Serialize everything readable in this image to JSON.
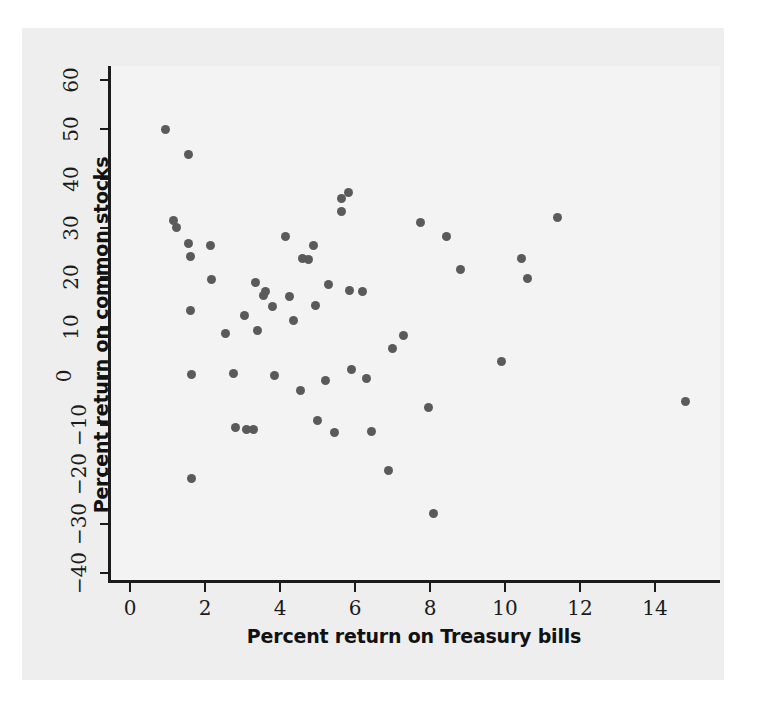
{
  "chart_data": {
    "type": "scatter",
    "title": "",
    "xlabel": "Percent return on Treasury bills",
    "ylabel": "Percent return on common stocks",
    "xlim": [
      -0.6,
      15.7
    ],
    "ylim": [
      -40,
      62
    ],
    "xticks": [
      0,
      2,
      4,
      6,
      8,
      10,
      12,
      14
    ],
    "xticklabels": [
      "0",
      "2",
      "4",
      "6",
      "8",
      "10",
      "12",
      "14"
    ],
    "yticks": [
      -40,
      -30,
      -20,
      -10,
      0,
      10,
      20,
      30,
      40,
      50,
      60
    ],
    "yticklabels": [
      "−40",
      "−30",
      "−20",
      "−10",
      "0",
      "10",
      "20",
      "30",
      "40",
      "50",
      "60"
    ],
    "grid": false,
    "legend": null,
    "marker_color": "#5a5a5a",
    "panel_color": "#f3f3f3",
    "figure_color": "#eeeeee",
    "axis_color": "#1b1b1b",
    "points": [
      [
        0.95,
        50.0
      ],
      [
        1.15,
        31.5
      ],
      [
        1.25,
        30.0
      ],
      [
        1.55,
        44.8
      ],
      [
        1.55,
        26.8
      ],
      [
        1.62,
        24.2
      ],
      [
        1.6,
        13.2
      ],
      [
        1.65,
        0.3
      ],
      [
        1.65,
        -20.9
      ],
      [
        2.15,
        26.5
      ],
      [
        2.18,
        19.5
      ],
      [
        2.55,
        8.5
      ],
      [
        2.75,
        0.5
      ],
      [
        2.8,
        -10.4
      ],
      [
        3.05,
        12.2
      ],
      [
        3.1,
        -10.9
      ],
      [
        3.3,
        -10.9
      ],
      [
        3.35,
        19.0
      ],
      [
        3.4,
        9.2
      ],
      [
        3.55,
        16.3
      ],
      [
        3.6,
        17.0
      ],
      [
        3.8,
        14.0
      ],
      [
        3.85,
        0.0
      ],
      [
        4.15,
        28.2
      ],
      [
        4.25,
        16.0
      ],
      [
        4.35,
        11.2
      ],
      [
        4.55,
        -2.9
      ],
      [
        4.6,
        23.8
      ],
      [
        4.75,
        23.5
      ],
      [
        4.9,
        26.5
      ],
      [
        4.95,
        14.2
      ],
      [
        5.0,
        -9.1
      ],
      [
        5.2,
        -1.0
      ],
      [
        5.3,
        18.5
      ],
      [
        5.45,
        -11.4
      ],
      [
        5.65,
        36.0
      ],
      [
        5.65,
        33.4
      ],
      [
        5.82,
        37.2
      ],
      [
        5.85,
        17.3
      ],
      [
        5.9,
        1.2
      ],
      [
        6.2,
        17.0
      ],
      [
        6.3,
        -0.6
      ],
      [
        6.45,
        -11.3
      ],
      [
        6.9,
        -19.3
      ],
      [
        7.0,
        5.6
      ],
      [
        7.3,
        8.2
      ],
      [
        7.75,
        31.0
      ],
      [
        7.95,
        -6.5
      ],
      [
        8.1,
        -28.0
      ],
      [
        8.45,
        28.2
      ],
      [
        8.8,
        21.5
      ],
      [
        9.9,
        2.9
      ],
      [
        10.45,
        23.7
      ],
      [
        10.6,
        19.8
      ],
      [
        11.4,
        32.2
      ],
      [
        14.8,
        -5.2
      ]
    ]
  }
}
